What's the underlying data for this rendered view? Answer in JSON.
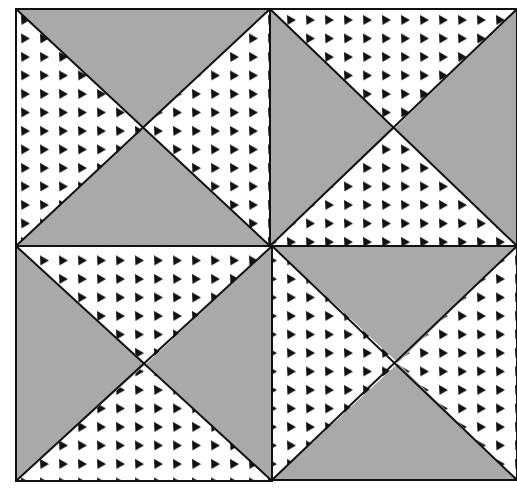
{
  "colors": {
    "background": "#ffffff",
    "solid_fill": "#a9a9a9",
    "print_fill": "#ffffff",
    "print_glyph": "#111111",
    "line": "#111111"
  },
  "pattern": {
    "glyph": "triangle-dot",
    "spacing_x": 19,
    "spacing_y": 18.5
  },
  "blocks": [
    {
      "name": "block-top-left",
      "x0": 16,
      "y0": 9,
      "x1": 270,
      "y1": 246,
      "cx": 144,
      "cy": 128,
      "orientation": "gray-top-bottom",
      "top": "solid",
      "bottom": "solid",
      "left": "print",
      "right": "print"
    },
    {
      "name": "block-top-right",
      "x0": 270,
      "y0": 9,
      "x1": 517,
      "y1": 246,
      "cx": 394,
      "cy": 129,
      "orientation": "gray-left-right",
      "top": "print",
      "bottom": "print",
      "left": "solid",
      "right": "solid"
    },
    {
      "name": "block-bottom-left",
      "x0": 16,
      "y0": 246,
      "x1": 272,
      "y1": 481,
      "cx": 146,
      "cy": 364,
      "orientation": "gray-left-right",
      "top": "print",
      "bottom": "print",
      "left": "solid",
      "right": "solid"
    },
    {
      "name": "block-bottom-right",
      "x0": 272,
      "y0": 246,
      "x1": 517,
      "y1": 480,
      "cx": 398,
      "cy": 363,
      "orientation": "gray-top-bottom",
      "top": "solid",
      "bottom": "solid",
      "left": "print",
      "right": "print"
    }
  ]
}
